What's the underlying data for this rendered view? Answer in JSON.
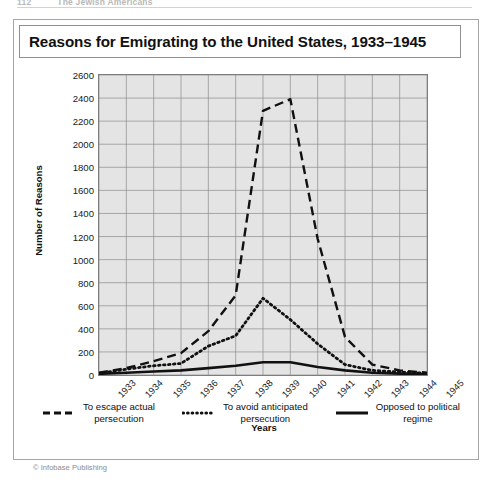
{
  "running_head": {
    "page_number": "112",
    "book_title": "The Jewish Americans"
  },
  "figure": {
    "title": "Reasons for Emigrating to the United States, 1933–1945",
    "credit": "© Infobase Publishing"
  },
  "legend": {
    "entries": [
      {
        "label": "To escape actual\npersecution",
        "style": "dashed",
        "icon": "dashed-line-icon"
      },
      {
        "label": "To avoid anticipated\npersecution",
        "style": "dotted",
        "icon": "dotted-line-icon"
      },
      {
        "label": "Opposed to political\nregime",
        "style": "solid",
        "icon": "solid-line-icon"
      }
    ]
  },
  "chart_data": {
    "type": "line",
    "title": "Reasons for Emigrating to the United States, 1933–1945",
    "xlabel": "Years",
    "ylabel": "Number of Reasons",
    "categories": [
      "1933",
      "1934",
      "1935",
      "1936",
      "1937",
      "1938",
      "1939",
      "1940",
      "1941",
      "1942",
      "1943",
      "1944",
      "1945"
    ],
    "x_tick_labels": [
      "1933",
      "1934",
      "1935",
      "1936",
      "1937",
      "1938",
      "1939",
      "1940",
      "1941",
      "1942",
      "1943",
      "1944",
      "1945"
    ],
    "y_tick_labels": [
      "2600",
      "2400",
      "2200",
      "2000",
      "1800",
      "1600",
      "1400",
      "1200",
      "1000",
      "800",
      "600",
      "400",
      "200",
      "0"
    ],
    "ylim": [
      0,
      2600
    ],
    "y_tick_step": 200,
    "grid": true,
    "legend_position": "below",
    "plot_background": "#e4e4e4",
    "line_color": "#111111",
    "series": [
      {
        "name": "To escape actual persecution",
        "style": "dashed",
        "values": [
          20,
          60,
          120,
          190,
          380,
          690,
          2290,
          2390,
          1180,
          330,
          90,
          40,
          20
        ]
      },
      {
        "name": "To avoid anticipated persecution",
        "style": "dotted",
        "values": [
          15,
          50,
          80,
          100,
          250,
          340,
          665,
          480,
          270,
          90,
          40,
          25,
          15
        ]
      },
      {
        "name": "Opposed to political regime",
        "style": "solid",
        "values": [
          10,
          20,
          30,
          40,
          60,
          80,
          110,
          110,
          70,
          40,
          20,
          12,
          8
        ]
      }
    ]
  }
}
